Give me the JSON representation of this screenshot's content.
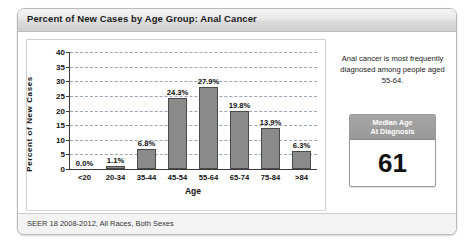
{
  "panel": {
    "title": "Percent of New Cases by Age Group: Anal Cancer",
    "footer": "SEER 18 2008-2012, All Races, Both Sexes"
  },
  "info": {
    "note": "Anal cancer is most frequently diagnosed among people aged 55-64.",
    "median_header_line1": "Median Age",
    "median_header_line2": "At Diagnosis",
    "median_value": "61"
  },
  "colors": {
    "bar_fill": "#8a8a8a",
    "bar_border": "#4a4a4a",
    "grid": "#9aa6b5",
    "median_header": "#999999"
  },
  "chart_data": {
    "type": "bar",
    "title": "Percent of New Cases by Age Group: Anal Cancer",
    "xlabel": "Age",
    "ylabel": "Percent of New Cases",
    "ylim": [
      0,
      40
    ],
    "yticks": [
      0,
      5,
      10,
      15,
      20,
      25,
      30,
      35,
      40
    ],
    "ytick_labels": [
      "0",
      "5",
      "10",
      "15",
      "20",
      "25",
      "30",
      "35",
      "40"
    ],
    "grid": true,
    "legend": "none",
    "categories": [
      "<20",
      "20-34",
      "35-44",
      "45-54",
      "55-64",
      "65-74",
      "75-84",
      ">84"
    ],
    "values": [
      0.0,
      1.1,
      6.8,
      24.3,
      27.9,
      19.8,
      13.9,
      6.3
    ],
    "data_labels": [
      "0.0%",
      "1.1%",
      "6.8%",
      "24.3%",
      "27.9%",
      "19.8%",
      "13.9%",
      "6.3%"
    ]
  }
}
